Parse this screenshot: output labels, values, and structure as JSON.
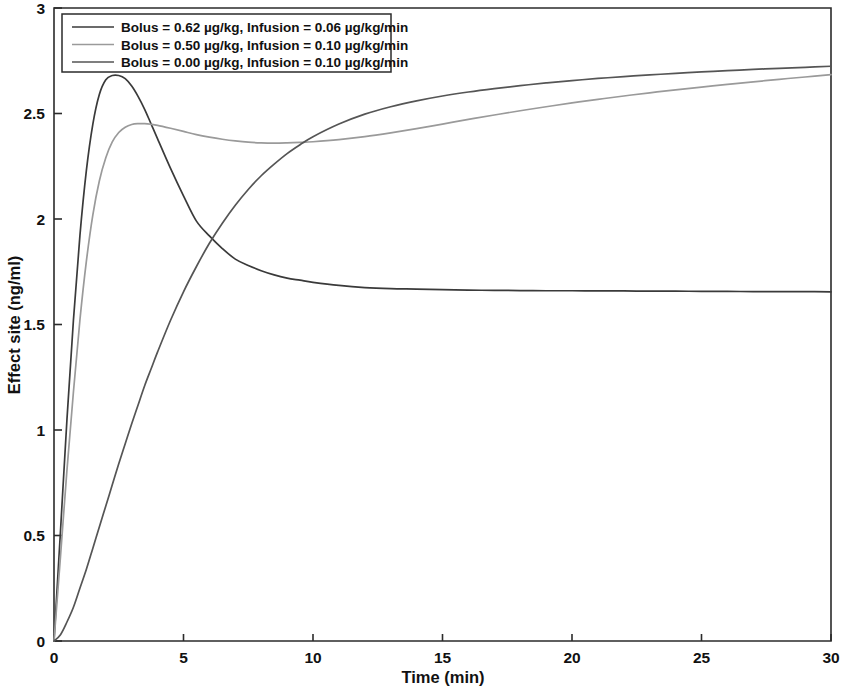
{
  "chart_data": {
    "type": "line",
    "title": "",
    "xlabel": "Time (min)",
    "ylabel": "Effect site (ng/ml)",
    "xlim": [
      0,
      30
    ],
    "ylim": [
      0,
      3
    ],
    "xticks": [
      0,
      5,
      10,
      15,
      20,
      25,
      30
    ],
    "yticks": [
      0,
      0.5,
      1,
      1.5,
      2,
      2.5,
      3
    ],
    "xtick_labels": [
      "0",
      "5",
      "10",
      "15",
      "20",
      "25",
      "30"
    ],
    "ytick_labels": [
      "0",
      "0.5",
      "1",
      "1.5",
      "2",
      "2.5",
      "3"
    ],
    "grid": false,
    "legend_position": "top-left",
    "x": [
      0,
      0.25,
      0.5,
      0.75,
      1,
      1.25,
      1.5,
      1.75,
      2,
      2.25,
      2.5,
      2.75,
      3,
      3.25,
      3.5,
      3.75,
      4,
      4.5,
      5,
      5.5,
      6,
      6.5,
      7,
      7.5,
      8,
      8.5,
      9,
      9.5,
      10,
      11,
      12,
      13,
      14,
      15,
      16,
      17,
      18,
      19,
      20,
      21,
      22,
      23,
      24,
      25,
      26,
      27,
      28,
      29,
      30
    ],
    "series": [
      {
        "name": "Bolus = 0.62 µg/kg, Infusion = 0.06 µg/kg/min",
        "color": "#3a3a3a",
        "bolus": 0.62,
        "infusion": 0.06,
        "peak_value": 2.68,
        "peak_time": 2.6,
        "plateau_value": 1.66,
        "values": [
          0,
          0.52,
          1.05,
          1.52,
          1.92,
          2.23,
          2.45,
          2.59,
          2.66,
          2.68,
          2.68,
          2.665,
          2.63,
          2.58,
          2.52,
          2.45,
          2.38,
          2.24,
          2.11,
          1.99,
          1.92,
          1.86,
          1.81,
          1.78,
          1.755,
          1.735,
          1.72,
          1.71,
          1.7,
          1.685,
          1.675,
          1.67,
          1.668,
          1.665,
          1.663,
          1.662,
          1.661,
          1.66,
          1.66,
          1.659,
          1.659,
          1.658,
          1.658,
          1.657,
          1.657,
          1.656,
          1.656,
          1.656,
          1.655
        ]
      },
      {
        "name": "Bolus = 0.50 µg/kg, Infusion = 0.10 µg/kg/min",
        "color": "#9a9a9a",
        "bolus": 0.5,
        "infusion": 0.1,
        "peak_value": 2.45,
        "peak_time": 3.8,
        "trough_value": 2.36,
        "trough_time": 7.6,
        "end_value": 2.71,
        "values": [
          0,
          0.4,
          0.81,
          1.18,
          1.52,
          1.8,
          2.02,
          2.18,
          2.29,
          2.365,
          2.41,
          2.435,
          2.448,
          2.452,
          2.452,
          2.449,
          2.444,
          2.43,
          2.415,
          2.4,
          2.388,
          2.378,
          2.37,
          2.364,
          2.361,
          2.36,
          2.361,
          2.363,
          2.366,
          2.376,
          2.39,
          2.408,
          2.428,
          2.45,
          2.472,
          2.493,
          2.513,
          2.532,
          2.55,
          2.567,
          2.583,
          2.598,
          2.612,
          2.625,
          2.638,
          2.65,
          2.662,
          2.673,
          2.684
        ]
      },
      {
        "name": "Bolus = 0.00 µg/kg, Infusion = 0.10 µg/kg/min",
        "color": "#555555",
        "bolus": 0.0,
        "infusion": 0.1,
        "end_value": 2.69,
        "values": [
          0,
          0.03,
          0.09,
          0.16,
          0.25,
          0.34,
          0.44,
          0.54,
          0.64,
          0.74,
          0.84,
          0.935,
          1.03,
          1.12,
          1.21,
          1.29,
          1.37,
          1.52,
          1.655,
          1.775,
          1.885,
          1.98,
          2.065,
          2.14,
          2.205,
          2.26,
          2.31,
          2.352,
          2.39,
          2.45,
          2.497,
          2.532,
          2.56,
          2.583,
          2.602,
          2.618,
          2.632,
          2.645,
          2.656,
          2.666,
          2.675,
          2.683,
          2.69,
          2.697,
          2.703,
          2.709,
          2.714,
          2.719,
          2.724
        ]
      }
    ]
  },
  "legend": {
    "entries": [
      "Bolus = 0.62 µg/kg, Infusion = 0.06 µg/kg/min",
      "Bolus = 0.50 µg/kg, Infusion = 0.10 µg/kg/min",
      "Bolus = 0.00 µg/kg, Infusion = 0.10 µg/kg/min"
    ]
  }
}
